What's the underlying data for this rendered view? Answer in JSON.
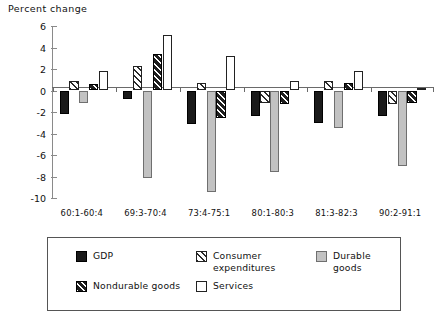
{
  "chart_data": {
    "type": "bar",
    "title": "Percent change",
    "xlabel": "",
    "ylabel": "Percent change",
    "ylim": [
      -10,
      6
    ],
    "yticks": [
      6,
      4,
      2,
      0,
      -2,
      -4,
      -6,
      -8,
      -10
    ],
    "ytick_labels": [
      "6",
      "4",
      "2",
      "0",
      "-2",
      "-4",
      "-6",
      "-8",
      "-10"
    ],
    "grid": false,
    "legend_position": "bottom",
    "categories": [
      "60:1-60:4",
      "69:3-70:4",
      "73:4-75:1",
      "80:1-80:3",
      "81:3-82:3",
      "90:2-91:1"
    ],
    "series": [
      {
        "name": "GDP",
        "key": "gdp",
        "pattern": "solid-black",
        "values": [
          -2.2,
          -0.8,
          -3.1,
          -2.4,
          -3.0,
          -2.4
        ]
      },
      {
        "name": "Consumer expenditures",
        "key": "ce",
        "pattern": "hatch-light",
        "values": [
          0.9,
          2.3,
          0.7,
          -1.2,
          0.9,
          -1.3
        ]
      },
      {
        "name": "Durable goods",
        "key": "dur",
        "pattern": "solid-gray",
        "values": [
          -1.2,
          -8.1,
          -9.4,
          -7.6,
          -3.5,
          -7.0
        ]
      },
      {
        "name": "Nondurable goods",
        "key": "nd",
        "pattern": "hatch-dark",
        "values": [
          0.6,
          3.4,
          -2.6,
          -1.3,
          0.7,
          -1.2
        ]
      },
      {
        "name": "Services",
        "key": "svc",
        "pattern": "open-white",
        "values": [
          1.8,
          5.2,
          3.2,
          0.9,
          1.8,
          0.2
        ]
      }
    ]
  },
  "legend": {
    "items": [
      {
        "label": "GDP"
      },
      {
        "label": "Consumer expenditures"
      },
      {
        "label": "Durable goods"
      },
      {
        "label": "Nondurable goods"
      },
      {
        "label": "Services"
      }
    ]
  },
  "colors": {
    "gdp": "#1a1a1a",
    "durable": "#c2c2c2",
    "services": "#ffffff",
    "axis": "#6a6a6a",
    "text": "#111111"
  }
}
